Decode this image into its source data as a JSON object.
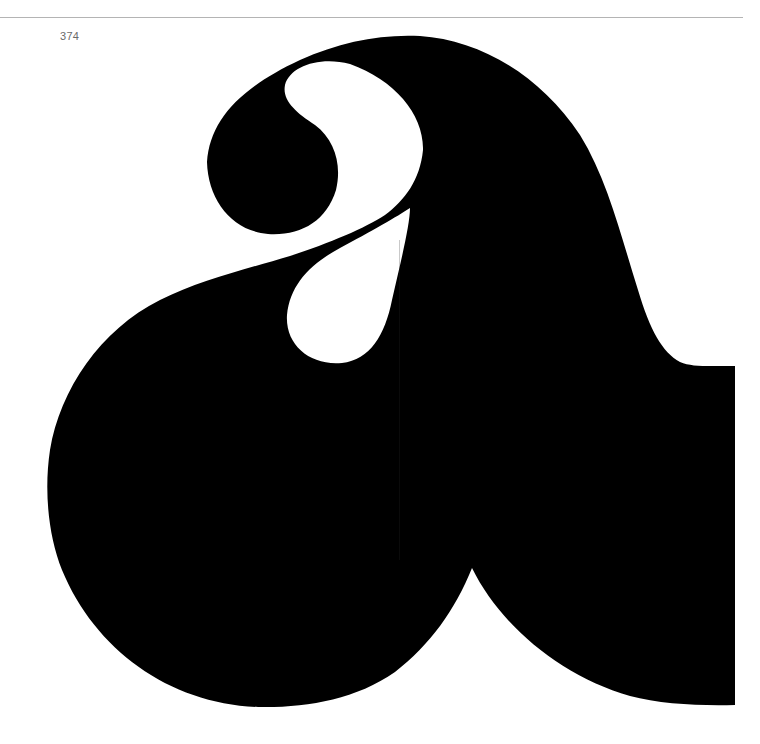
{
  "page": {
    "number": "374",
    "header_rule": true
  },
  "specimen": {
    "glyph": "a",
    "description": "Display typeface specimen — lowercase a",
    "fill_color": "#000000",
    "background_color": "#ffffff"
  }
}
